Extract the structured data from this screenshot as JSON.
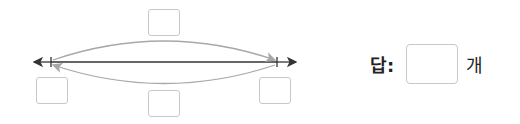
{
  "diagram": {
    "line_color": "#333333",
    "arc_color": "#a8a8a8",
    "box_border_color": "#c8c8c8",
    "boxes": [
      {
        "id": "top",
        "value": ""
      },
      {
        "id": "bottom-left",
        "value": ""
      },
      {
        "id": "bottom-middle",
        "value": ""
      },
      {
        "id": "bottom-right",
        "value": ""
      }
    ]
  },
  "answer": {
    "label": "답:",
    "value": "",
    "unit": "개"
  }
}
